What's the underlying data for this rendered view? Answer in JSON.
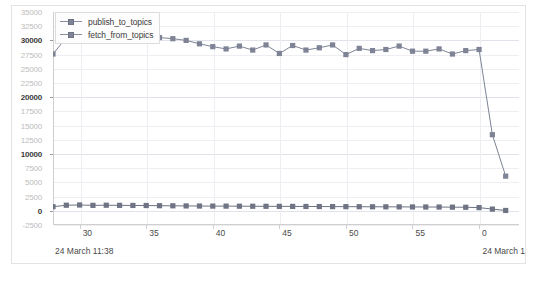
{
  "chart_data": {
    "type": "line",
    "title": "",
    "subtitle": "",
    "xlabel": "",
    "ylabel": "",
    "grid": true,
    "legend_position": "top-left",
    "ylim": [
      -2500,
      35000
    ],
    "ytick_values": [
      35000,
      32500,
      30000,
      27500,
      25000,
      22500,
      20000,
      17500,
      15000,
      12500,
      10000,
      7500,
      5000,
      2500,
      0,
      -2500
    ],
    "ytick_labels": [
      "35000",
      "32500",
      "30000",
      "27500",
      "25000",
      "22500",
      "20000",
      "17500",
      "15000",
      "12500",
      "10000",
      "7500",
      "5000",
      "2500",
      "0",
      "-2500"
    ],
    "ytick_major": [
      30000,
      20000,
      10000,
      0
    ],
    "xlim": [
      28,
      63
    ],
    "xtick_values": [
      30,
      35,
      40,
      45,
      50,
      55,
      60
    ],
    "xtick_labels": [
      "30",
      "35",
      "40",
      "45",
      "50",
      "55",
      "0"
    ],
    "x": [
      28,
      29,
      30,
      31,
      32,
      33,
      34,
      35,
      36,
      37,
      38,
      39,
      40,
      41,
      42,
      43,
      44,
      45,
      46,
      47,
      48,
      49,
      50,
      51,
      52,
      53,
      54,
      55,
      56,
      57,
      58,
      59,
      60,
      61,
      62
    ],
    "series": [
      {
        "name": "fetch_from_topics",
        "color": "#7e8496",
        "values": [
          27600,
          30500,
          30550,
          30450,
          30400,
          30700,
          30500,
          30600,
          30500,
          30300,
          30000,
          29400,
          28900,
          28500,
          29000,
          28300,
          29200,
          27700,
          29100,
          28300,
          28700,
          29200,
          27500,
          28600,
          28200,
          28400,
          29000,
          28100,
          28100,
          28500,
          27600,
          28200,
          28400,
          13400,
          6100
        ]
      },
      {
        "name": "publish_to_topics",
        "color": "#6f7485",
        "values": [
          720,
          980,
          1020,
          960,
          980,
          960,
          940,
          930,
          900,
          880,
          860,
          840,
          830,
          820,
          810,
          800,
          790,
          780,
          770,
          760,
          750,
          740,
          730,
          720,
          710,
          700,
          690,
          680,
          670,
          660,
          640,
          620,
          560,
          300,
          60
        ]
      }
    ],
    "annotations": {
      "footer_left": "24 March 11:38",
      "footer_right": "24 March 1"
    }
  },
  "legend": {
    "items": [
      {
        "label": "publish_to_topics"
      },
      {
        "label": "fetch_from_topics"
      }
    ]
  },
  "footer": {
    "left": "24 March 11:38",
    "right": "24 March 1"
  }
}
